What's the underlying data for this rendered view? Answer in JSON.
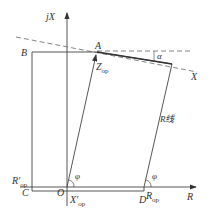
{
  "diagram": {
    "type": "impedance-plane characteristic",
    "axes": {
      "vertical": "jX",
      "horizontal": "R"
    },
    "points": {
      "A": "A",
      "B": "B",
      "C": "C",
      "D": "D",
      "O": "O"
    },
    "labels": {
      "z_main": "Z",
      "z_sub": "op",
      "x_line": "X",
      "alpha": "α",
      "r_line": "R线",
      "phi_origin": "φ",
      "phi_right": "φ",
      "r_op_left_main": "R′",
      "r_op_left_sub": "op",
      "r_op_right_main": "R",
      "r_op_right_sub": "op",
      "x_op_main": "X′",
      "x_op_sub": "op"
    },
    "colors": {
      "line": "#444444",
      "text": "#333333"
    }
  }
}
